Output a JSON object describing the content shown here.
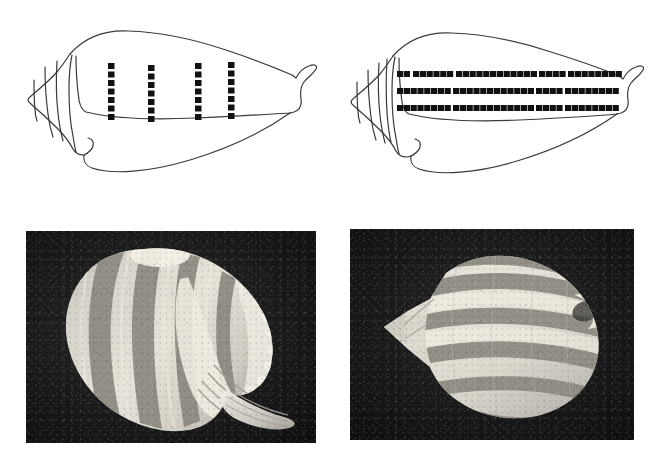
{
  "figure": {
    "background_color": "#ffffff",
    "ink_color": "#2b2b2b",
    "marking_color": "#111111",
    "photo_background_color": "#171717"
  },
  "panels": [
    {
      "id": "drawing-left",
      "label": "Line drawing of shell with four vertical rows of square markings",
      "kind": "line-drawing",
      "position": "top-left",
      "outline_stroke": "#3a3a3a",
      "outline_stroke_width": 1.2,
      "spire_line_count": 3,
      "aperture_notch": "siphonal canal at right tip",
      "markings": {
        "arrangement": "vertical-columns",
        "column_count": 4,
        "squares_per_column": 7,
        "square_size_px": 6,
        "column_x_positions": [
          111,
          151,
          198,
          231
        ],
        "column_top_y": 63,
        "column_bottom_y": 119,
        "color": "#111111"
      }
    },
    {
      "id": "drawing-right",
      "label": "Line drawing of shell with three horizontal rows of square markings",
      "kind": "line-drawing",
      "position": "top-right",
      "outline_stroke": "#3a3a3a",
      "outline_stroke_width": 1.2,
      "spire_line_count": 4,
      "aperture_notch": "siphonal canal at right tip",
      "markings": {
        "arrangement": "horizontal-rows",
        "row_count": 3,
        "squares_per_row": 32,
        "square_size_px": 6,
        "row_y_positions": [
          73,
          90,
          107
        ],
        "row_left_x": 62,
        "row_right_x": 277,
        "color": "#111111"
      }
    },
    {
      "id": "photo-left",
      "label": "Grayscale photograph of a ribbed striped shell, apertural three-quarter view",
      "kind": "photograph",
      "position": "bottom-left",
      "background_color": "#171717",
      "subject": "shell with spiral dark bands and scalloped outer lip",
      "band_count": 6,
      "orientation": "three-quarter view, spire up, siphonal canal lower right"
    },
    {
      "id": "photo-right",
      "label": "Grayscale photograph of a banded ovate shell, dorsal view",
      "kind": "photograph",
      "position": "bottom-right",
      "background_color": "#171717",
      "subject": "ovate shell with broad dark spiral bands",
      "band_count": 5,
      "orientation": "dorsal view, spire left, siphonal canal right"
    }
  ]
}
